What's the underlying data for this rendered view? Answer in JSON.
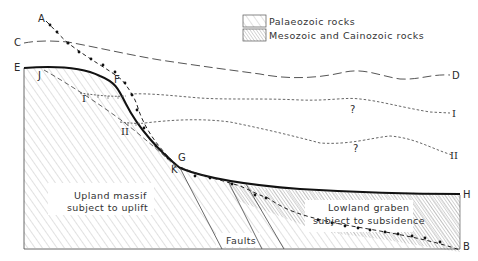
{
  "legend": {
    "items": [
      {
        "label": "Palaeozoic rocks",
        "pattern": "sparse-diagonal-hatch"
      },
      {
        "label": "Mesozoic and Cainozoic rocks",
        "pattern": "dense-diagonal-hatch"
      }
    ]
  },
  "point_labels": {
    "A": "A",
    "B": "B",
    "C": "C",
    "D": "D",
    "E": "E",
    "F": "F",
    "G": "G",
    "H": "H",
    "J": "J",
    "K": "K",
    "I": "I",
    "II": "II"
  },
  "uncertain_marks": [
    "?",
    "?"
  ],
  "regions": {
    "upland_line1": "Upland massif",
    "upland_line2": "subject to uplift",
    "lowland_line1": "Lowland graben",
    "lowland_line2": "subject to subsidence",
    "faults": "Faults"
  },
  "colors": {
    "line": "#1a1a1a",
    "hatch": "#9a9a9a",
    "dense_hatch": "#7a7a7a",
    "background": "#ffffff"
  }
}
